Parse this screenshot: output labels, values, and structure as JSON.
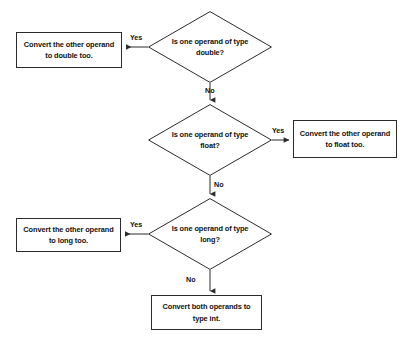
{
  "diagram": {
    "background_color": "#ffffff",
    "stroke_color": "#2b2b2b",
    "text_color": "#111111",
    "nodes": [
      {
        "id": "d1",
        "shape": "decision",
        "text": "Is one operand of type double?",
        "line1": "Is one operand of type",
        "line2": "double?",
        "x": 148,
        "y": 11,
        "w": 124,
        "h": 72
      },
      {
        "id": "b1",
        "shape": "process",
        "text": "Convert the other operand to double too.",
        "line1": "Convert the other operand",
        "line2": "to double too.",
        "x": 16,
        "y": 32,
        "w": 106,
        "h": 36
      },
      {
        "id": "d2",
        "shape": "decision",
        "text": "Is one operand of type float?",
        "line1": "Is one operand of type",
        "line2": "float?",
        "x": 148,
        "y": 104,
        "w": 124,
        "h": 72
      },
      {
        "id": "b2",
        "shape": "process",
        "text": "Convert the other operand to float too.",
        "line1": "Convert the other operand",
        "line2": "to float too.",
        "x": 293,
        "y": 120,
        "w": 104,
        "h": 38
      },
      {
        "id": "d3",
        "shape": "decision",
        "text": "Is one operand of type long?",
        "line1": "Is one operand of type",
        "line2": "long?",
        "x": 148,
        "y": 198,
        "w": 124,
        "h": 72
      },
      {
        "id": "b3",
        "shape": "process",
        "text": "Convert the other operand to long too.",
        "line1": "Convert the other operand",
        "line2": "to long too.",
        "x": 16,
        "y": 218,
        "w": 105,
        "h": 34
      },
      {
        "id": "b4",
        "shape": "process",
        "text": "Convert both operands to type int.",
        "line1": "Convert both operands to",
        "line2": "type int.",
        "x": 151,
        "y": 295,
        "w": 111,
        "h": 35
      }
    ],
    "edges": [
      {
        "id": "e1",
        "from": "d1",
        "to": "b1",
        "label": "Yes",
        "label_x": 130,
        "label_y": 33
      },
      {
        "id": "e2",
        "from": "d1",
        "to": "d2",
        "label": "No",
        "label_x": 205,
        "label_y": 89
      },
      {
        "id": "e3",
        "from": "d2",
        "to": "b2",
        "label": "Yes",
        "label_x": 272,
        "label_y": 126
      },
      {
        "id": "e4",
        "from": "d2",
        "to": "d3",
        "label": "No",
        "label_x": 214,
        "label_y": 182
      },
      {
        "id": "e5",
        "from": "d3",
        "to": "b3",
        "label": "Yes",
        "label_x": 130,
        "label_y": 220
      },
      {
        "id": "e6",
        "from": "d3",
        "to": "b4",
        "label": "No",
        "label_x": 186,
        "label_y": 277
      }
    ]
  }
}
